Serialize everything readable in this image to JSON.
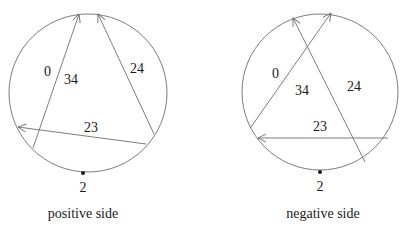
{
  "diagrams": [
    {
      "id": "positive",
      "caption": "positive side",
      "circle": {
        "cx": 88,
        "cy": 93,
        "r": 79
      },
      "chords": [
        {
          "name": "chord-0-34",
          "x1": 33,
          "y1": 148,
          "x2": 79,
          "y2": 14
        },
        {
          "name": "chord-24",
          "x1": 154,
          "y1": 134,
          "x2": 98,
          "y2": 14
        },
        {
          "name": "chord-23",
          "x1": 146,
          "y1": 144,
          "x2": 18,
          "y2": 127
        }
      ],
      "labels": [
        {
          "text": "0",
          "x": 44,
          "y": 76
        },
        {
          "text": "34",
          "x": 64,
          "y": 84
        },
        {
          "text": "24",
          "x": 130,
          "y": 73
        },
        {
          "text": "23",
          "x": 84,
          "y": 132
        }
      ],
      "basepoint": {
        "x": 83,
        "y": 173,
        "label": "2",
        "lx": 83,
        "ly": 192
      },
      "caption_pos": {
        "x": 83,
        "y": 218
      }
    },
    {
      "id": "negative",
      "caption": "negative side",
      "circle": {
        "cx": 320,
        "cy": 92,
        "r": 78
      },
      "chords": [
        {
          "name": "chord-0-34",
          "x1": 251,
          "y1": 127,
          "x2": 331,
          "y2": 13
        },
        {
          "name": "chord-24",
          "x1": 365,
          "y1": 162,
          "x2": 293,
          "y2": 18
        },
        {
          "name": "chord-23",
          "x1": 388,
          "y1": 138,
          "x2": 258,
          "y2": 138
        }
      ],
      "labels": [
        {
          "text": "0",
          "x": 272,
          "y": 78
        },
        {
          "text": "34",
          "x": 295,
          "y": 95
        },
        {
          "text": "24",
          "x": 347,
          "y": 91
        },
        {
          "text": "23",
          "x": 313,
          "y": 131
        }
      ],
      "basepoint": {
        "x": 320,
        "y": 172,
        "label": "2",
        "lx": 320,
        "ly": 191
      },
      "caption_pos": {
        "x": 323,
        "y": 218
      }
    }
  ],
  "style": {
    "stroke": "#6e6e6e",
    "text": "#1a1a1a",
    "dot": "#1a1a1a"
  }
}
